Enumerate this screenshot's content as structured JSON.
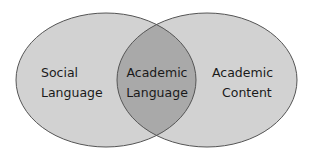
{
  "diagram": {
    "type": "venn",
    "sets": [
      {
        "id": "left",
        "label_lines": [
          "Social",
          "Language"
        ]
      },
      {
        "id": "right",
        "label_lines": [
          "Academic",
          "Content"
        ]
      }
    ],
    "intersection": {
      "label_lines": [
        "Academic",
        "Language"
      ]
    },
    "colors": {
      "outer_fill": "#d2d2d2",
      "overlap_fill": "#a9a9a9",
      "stroke": "#555555",
      "text": "#1a1a1a"
    }
  }
}
